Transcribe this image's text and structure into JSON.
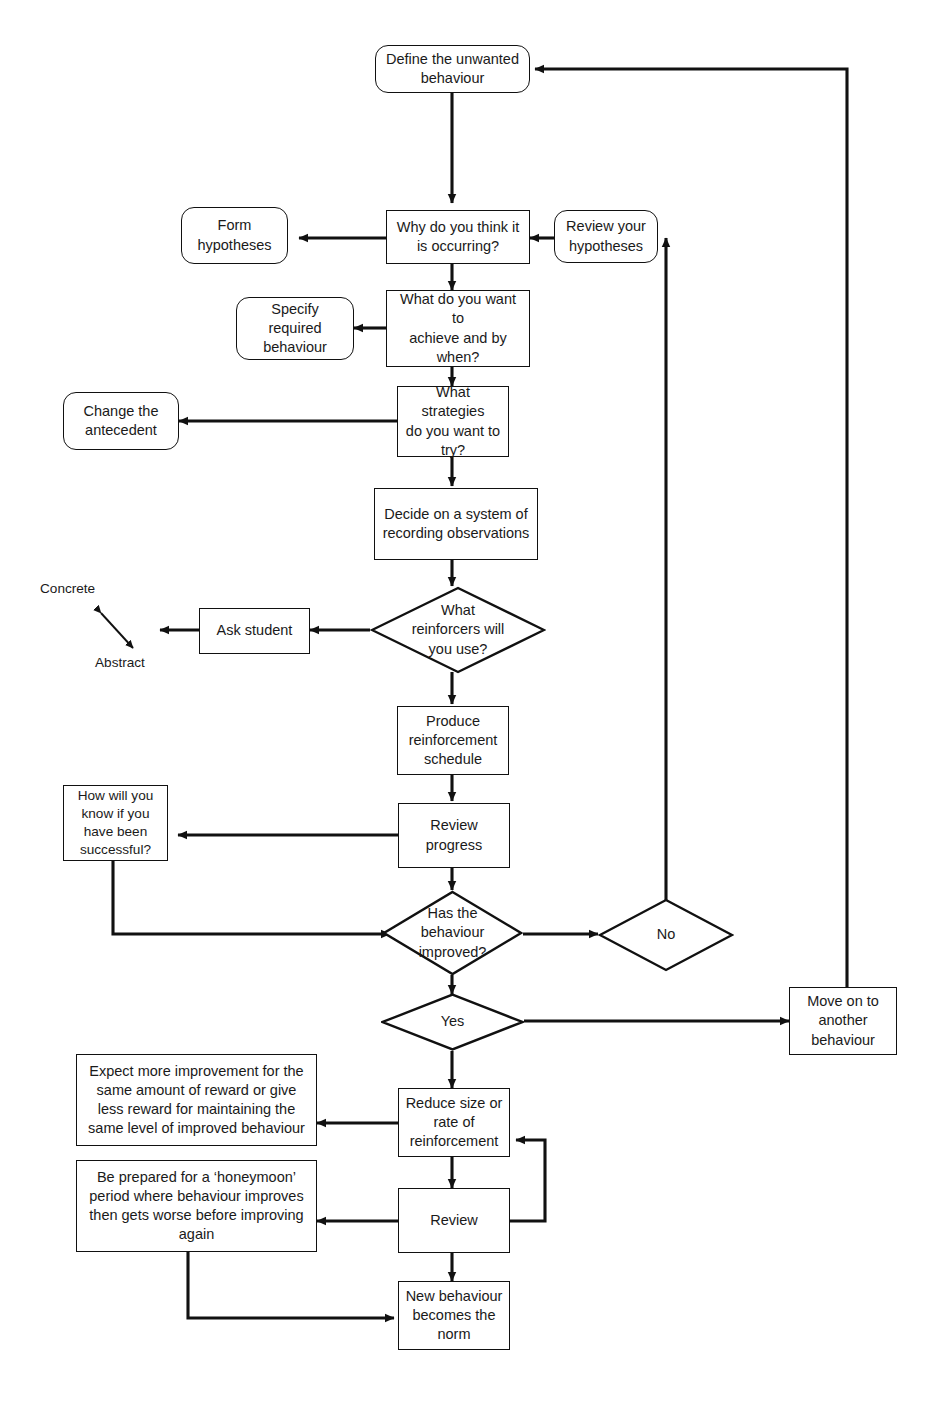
{
  "diagram": {
    "stroke_color": "#111111",
    "background": "#ffffff"
  },
  "nodes": {
    "define_behaviour": {
      "text": "Define the unwanted\nbehaviour",
      "shape": "rounded-rectangle"
    },
    "form_hypotheses": {
      "text": "Form\nhypotheses",
      "shape": "rounded-rectangle"
    },
    "why_occurring": {
      "text": "Why do you think it\nis occurring?",
      "shape": "rectangle"
    },
    "review_hypotheses": {
      "text": "Review your\nhypotheses",
      "shape": "rounded-rectangle"
    },
    "specify_behaviour": {
      "text": "Specify\nrequired\nbehaviour",
      "shape": "rounded-rectangle"
    },
    "achieve_when": {
      "text": "What do you want to\nachieve and by\nwhen?",
      "shape": "rectangle"
    },
    "change_antecedent": {
      "text": "Change the\nantecedent",
      "shape": "rounded-rectangle"
    },
    "what_strategies": {
      "text": "What strategies\ndo you want to\ntry?",
      "shape": "rectangle"
    },
    "decide_recording": {
      "text": "Decide on a system of\nrecording observations",
      "shape": "rectangle"
    },
    "ask_student": {
      "text": "Ask student",
      "shape": "rectangle"
    },
    "what_reinforcers": {
      "text": "What\nreinforcers will\nyou use?",
      "shape": "diamond"
    },
    "produce_schedule": {
      "text": "Produce\nreinforcement\nschedule",
      "shape": "rectangle"
    },
    "how_know_successful": {
      "text": "How will you\nknow if you\nhave been\nsuccessful?",
      "shape": "rectangle"
    },
    "review_progress": {
      "text": "Review progress",
      "shape": "rectangle"
    },
    "has_improved": {
      "text": "Has the\nbehaviour\nimproved?",
      "shape": "diamond"
    },
    "no": {
      "text": "No",
      "shape": "diamond"
    },
    "yes": {
      "text": "Yes",
      "shape": "diamond"
    },
    "move_on": {
      "text": "Move on to\nanother\nbehaviour",
      "shape": "rectangle"
    },
    "expect_more": {
      "text": "Expect more improvement for the\nsame amount of reward or give\nless reward for maintaining the\nsame level of improved behaviour",
      "shape": "rectangle"
    },
    "reduce_size": {
      "text": "Reduce size or\nrate of\nreinforcement",
      "shape": "rectangle"
    },
    "honeymoon": {
      "text": "Be prepared for a ‘honeymoon’\nperiod where behaviour improves\nthen gets worse before improving\nagain",
      "shape": "rectangle"
    },
    "review": {
      "text": "Review",
      "shape": "rectangle"
    },
    "new_behaviour_norm": {
      "text": "New behaviour\nbecomes the\nnorm",
      "shape": "rectangle"
    }
  },
  "annotations": {
    "concrete": "Concrete",
    "abstract": "Abstract",
    "scale_arrow": "double-headed-arrow"
  }
}
